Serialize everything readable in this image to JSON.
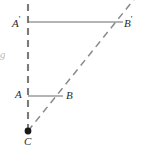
{
  "figure": {
    "background_color": "#ffffff",
    "width": 150,
    "height": 168,
    "line_color": "#6e6e6e",
    "solid_line_color": "#6b6b6b",
    "label_color": "#2b2b2b",
    "point_color": "#1a1a1a"
  },
  "labels": {
    "a_prime": "A",
    "a_prime_mark": "'",
    "b_prime": "B",
    "b_prime_mark": "'",
    "a": "A",
    "b": "B",
    "c": "C",
    "edge_fragment": "g"
  },
  "points": {
    "C": {
      "x": 28,
      "y": 131,
      "marker": "filled-dot",
      "label": "C"
    },
    "A": {
      "x": 28,
      "y": 96,
      "marker": "none",
      "label": "A"
    },
    "B": {
      "x": 62,
      "y": 96,
      "marker": "none",
      "label": "B"
    },
    "A_prime": {
      "x": 28,
      "y": 22,
      "marker": "none",
      "label": "A'"
    },
    "B_prime": {
      "x": 122,
      "y": 22,
      "marker": "none",
      "label": "B'"
    }
  },
  "segments": [
    {
      "name": "segment-ab",
      "style": "solid",
      "from": "A",
      "to": "B"
    },
    {
      "name": "segment-a-prime-b-prime",
      "style": "solid",
      "from": "A'",
      "to": "B'"
    }
  ],
  "rays": [
    {
      "name": "ray-vertical-dashed",
      "style": "dashed",
      "from_x": 28,
      "from_y": 131,
      "to_x": 28,
      "to_y": 0
    },
    {
      "name": "ray-diagonal-dashed",
      "style": "dashed",
      "from_x": 28,
      "from_y": 131,
      "to_x": 150,
      "to_y": -22
    }
  ]
}
